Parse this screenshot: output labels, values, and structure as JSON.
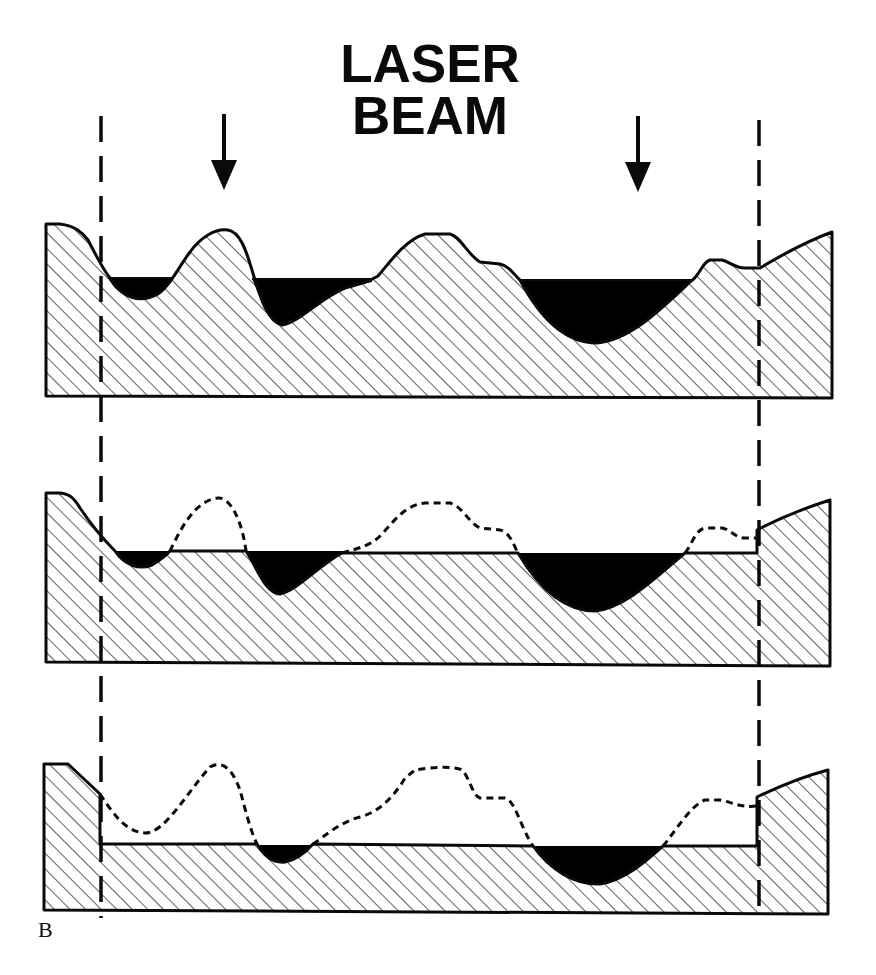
{
  "figure": {
    "title_line1": "LASER",
    "title_line2": "BEAM",
    "panel_label": "B",
    "colors": {
      "ink": "#0a0a0a",
      "background": "#ffffff",
      "molten_fill": "#000000"
    },
    "elements": [
      {
        "name": "laser-arrow-left",
        "description": "Downward arrow indicating laser beam incidence",
        "x": 224
      },
      {
        "name": "laser-arrow-right",
        "description": "Downward arrow indicating laser beam incidence",
        "x": 638
      },
      {
        "name": "scan-boundary-left",
        "description": "Dashed vertical line marking left edge of laser-treated region",
        "x": 100
      },
      {
        "name": "scan-boundary-right",
        "description": "Dashed vertical line marking right edge of laser-treated region",
        "x": 760
      }
    ],
    "stages": [
      {
        "index": 1,
        "description": "Rough hatched substrate surface with solid black filled valleys under a level line"
      },
      {
        "index": 2,
        "description": "Peaks removed to level; original profile shown dashed; black pools remain"
      },
      {
        "index": 3,
        "description": "Surface lowered further to a new flat level; dashed original profile; smaller black pools"
      }
    ]
  }
}
